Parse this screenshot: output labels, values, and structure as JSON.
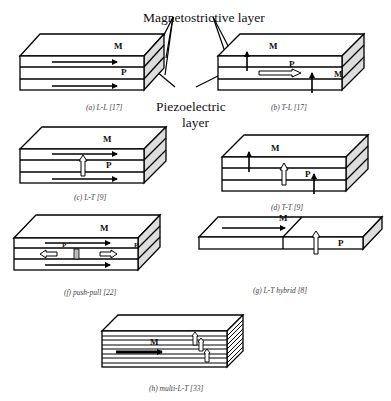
{
  "callouts": {
    "magnetostrictive": "Magnetostrictive layer",
    "piezoelectric_line1": "Piezoelectric",
    "piezoelectric_line2": "layer"
  },
  "panels": [
    {
      "id": "a",
      "caption": "(a) L-L [17]",
      "labels": {
        "m": "M",
        "p": "P"
      }
    },
    {
      "id": "b",
      "caption": "(b) T-L [17]",
      "labels": {
        "m": "M",
        "p": "P",
        "m2": "M"
      }
    },
    {
      "id": "c",
      "caption": "(c) L-T [9]",
      "labels": {
        "m": "M",
        "p": "P"
      }
    },
    {
      "id": "d",
      "caption": "(d) T-T [9]",
      "labels": {
        "m": "M",
        "p": "P"
      }
    },
    {
      "id": "f",
      "caption": "(f) push-pull [22]",
      "labels": {
        "m": "M",
        "p": "P",
        "p2": "P"
      }
    },
    {
      "id": "g",
      "caption": "(g) L-T hybrid [8]",
      "labels": {
        "m": "M",
        "p": "P"
      }
    },
    {
      "id": "h",
      "caption": "(h) multi-L-T [33]",
      "labels": {
        "m": "M"
      }
    }
  ],
  "colors": {
    "stroke": "#000000",
    "side_fill": "#d9d9d9",
    "caption": "#444444"
  }
}
